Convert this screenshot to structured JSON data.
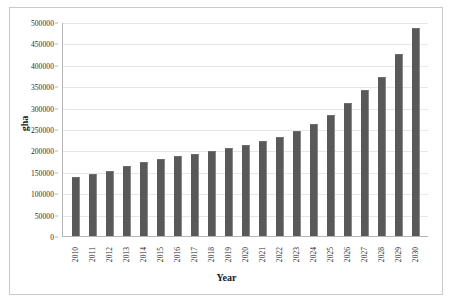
{
  "chart_data": {
    "type": "bar",
    "title": "",
    "xlabel": "Year",
    "ylabel": "gha",
    "categories": [
      "2010",
      "2011",
      "2012",
      "2013",
      "2014",
      "2015",
      "2016",
      "2017",
      "2018",
      "2019",
      "2020",
      "2021",
      "2022",
      "2023",
      "2024",
      "2025",
      "2026",
      "2027",
      "2028",
      "2029",
      "2030"
    ],
    "values": [
      138000,
      145000,
      152000,
      163000,
      172000,
      180000,
      186000,
      192000,
      198000,
      205000,
      213000,
      222000,
      232000,
      245000,
      262000,
      283000,
      310000,
      340000,
      372000,
      425000,
      487000
    ],
    "ylim": [
      0,
      500000
    ],
    "yticks": [
      0,
      50000,
      100000,
      150000,
      200000,
      250000,
      300000,
      350000,
      400000,
      450000,
      500000
    ],
    "ytick_labels": [
      "0",
      "50000",
      "100000",
      "150000",
      "200000",
      "250000",
      "300000",
      "350000",
      "400000",
      "450000",
      "500000"
    ],
    "grid": true,
    "legend": false,
    "bar_color": "#595959",
    "gridline_color": "#e6e6e6",
    "axis_color": "#b6b6b6"
  }
}
